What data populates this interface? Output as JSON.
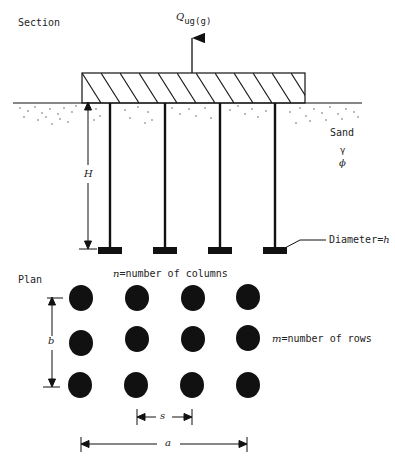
{
  "section": {
    "title": "Section",
    "load_label": "Q",
    "load_subscript": "ug(g)",
    "soil_label": "Sand",
    "soil_params": [
      "γ",
      "ϕ"
    ],
    "depth_label": "H",
    "diameter_label": "Diameter=",
    "diameter_var": "h",
    "pile_count": 4
  },
  "plan": {
    "title": "Plan",
    "columns_var": "n",
    "columns_label": "=number of columns",
    "rows_var": "m",
    "rows_label": "=number of rows",
    "height_dim": "b",
    "spacing_dim": "s",
    "width_dim": "a",
    "grid": {
      "columns": 4,
      "rows": 3
    }
  },
  "colors": {
    "ink": "#111111",
    "background": "#ffffff"
  }
}
